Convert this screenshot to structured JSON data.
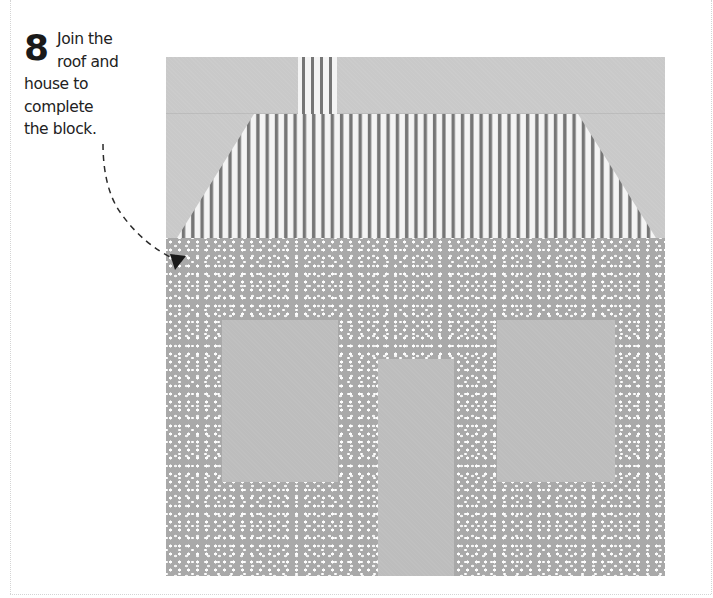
{
  "instruction": {
    "step_number": "8",
    "lines": [
      "Join the",
      "roof and",
      "house to",
      "complete",
      "the block."
    ]
  },
  "illustration": {
    "subject": "house quilt block",
    "components": [
      "sky-panel",
      "chimney",
      "roof",
      "house-body",
      "left-window",
      "right-window",
      "door"
    ],
    "colors": {
      "sky": "#c9c9c9",
      "roof_stripe_dark": "#767676",
      "roof_stripe_light": "#f4f4f4",
      "house_fabric": "#a9a9a9",
      "house_dots": "#ffffff",
      "windows_door": "#bdbdbd",
      "arrow": "#2a2a2a"
    }
  },
  "icons": {
    "pointer_arrow": "dashed-curved-arrow-icon"
  }
}
